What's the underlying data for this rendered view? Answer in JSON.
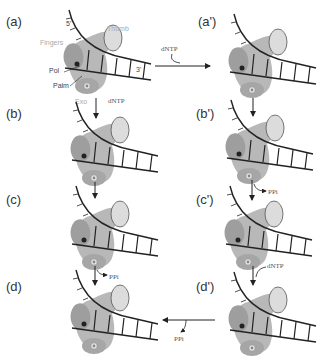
{
  "panels": [
    {
      "id": "a",
      "label": "(a)"
    },
    {
      "id": "a_prime",
      "label": "(a')"
    },
    {
      "id": "b",
      "label": "(b)"
    },
    {
      "id": "b_prime",
      "label": "(b')"
    },
    {
      "id": "c",
      "label": "(c)"
    },
    {
      "id": "c_prime",
      "label": "(c')"
    },
    {
      "id": "d",
      "label": "(d)"
    },
    {
      "id": "d_prime",
      "label": "(d')"
    }
  ],
  "parts": {
    "fingers": "Fingers",
    "thumb": "Thumb",
    "pol": "Pol",
    "palm": "Palm",
    "exo": "Exo",
    "five_prime": "5'",
    "three_prime": "3'"
  },
  "transitions": {
    "a_to_a_prime": "dNTP",
    "a_to_b": "dNTP",
    "b_prime_to_c_prime": "PPi",
    "c_prime_to_d_prime": "dNTP",
    "d_prime_to_d": "PPi",
    "c_to_d": "PPi"
  },
  "colors": {
    "palm": "#b8b8b8",
    "fingers": "#9e9e9e",
    "thumb": "#dcdcdc",
    "exo_dot": "#cfcfcf",
    "pol_dot": "#222222",
    "dna": "#222222"
  }
}
